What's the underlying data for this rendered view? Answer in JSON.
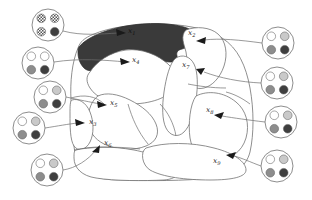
{
  "figure": {
    "background_color": "#ffffff",
    "stroke_color": "#6f6f6f",
    "shaded_region_color": "#3a3a3a",
    "width": 312,
    "height": 200
  },
  "palette": {
    "white": "#ffffff",
    "light_gray": "#c9c9c9",
    "medium_gray": "#8d8d8d",
    "dark_gray": "#3f3f3f",
    "outline": "#707070",
    "shaded": "#3a3a3a",
    "checker": "#555555"
  },
  "region_labels": [
    {
      "id": "x1",
      "base": "x",
      "sub": "1",
      "x": 128,
      "y": 33,
      "on_dark": true
    },
    {
      "id": "x2",
      "base": "x",
      "sub": "2",
      "x": 188,
      "y": 35,
      "on_dark": false
    },
    {
      "id": "x3",
      "base": "x",
      "sub": "3",
      "x": 89,
      "y": 124,
      "on_dark": false
    },
    {
      "id": "x4",
      "base": "x",
      "sub": "4",
      "x": 132,
      "y": 62,
      "on_dark": false
    },
    {
      "id": "x5",
      "base": "x",
      "sub": "5",
      "x": 110,
      "y": 105,
      "on_dark": false
    },
    {
      "id": "x6",
      "base": "x",
      "sub": "6",
      "x": 104,
      "y": 145,
      "on_dark": false
    },
    {
      "id": "x7",
      "base": "x",
      "sub": "7",
      "x": 182,
      "y": 67,
      "on_dark": false
    },
    {
      "id": "x8",
      "base": "x",
      "sub": "8",
      "x": 206,
      "y": 112,
      "on_dark": false
    },
    {
      "id": "x9",
      "base": "x",
      "sub": "9",
      "x": 213,
      "y": 163,
      "on_dark": false
    }
  ],
  "marbles": [
    {
      "id": "marble-1",
      "side": "left",
      "cx": 48,
      "cy": 25,
      "r": 16,
      "dots": [
        "checker",
        "checker",
        "checker",
        "dark_gray"
      ],
      "linked_region": "x1"
    },
    {
      "id": "marble-2",
      "side": "left",
      "cx": 38,
      "cy": 63,
      "r": 16,
      "dots": [
        "white",
        "white",
        "medium_gray",
        "dark_gray"
      ],
      "linked_region": "x4"
    },
    {
      "id": "marble-3",
      "side": "left",
      "cx": 50,
      "cy": 97,
      "r": 16,
      "dots": [
        "white",
        "light_gray",
        "medium_gray",
        "dark_gray"
      ],
      "linked_region": "x5"
    },
    {
      "id": "marble-4",
      "side": "left",
      "cx": 29,
      "cy": 128,
      "r": 16,
      "dots": [
        "white",
        "light_gray",
        "medium_gray",
        "dark_gray"
      ],
      "linked_region": "x3"
    },
    {
      "id": "marble-5",
      "side": "left",
      "cx": 47,
      "cy": 170,
      "r": 16,
      "dots": [
        "white",
        "light_gray",
        "medium_gray",
        "dark_gray"
      ],
      "linked_region": "x6"
    },
    {
      "id": "marble-6",
      "side": "right",
      "cx": 278,
      "cy": 43,
      "r": 16,
      "dots": [
        "white",
        "light_gray",
        "medium_gray",
        "dark_gray"
      ],
      "linked_region": "x2"
    },
    {
      "id": "marble-7",
      "side": "right",
      "cx": 277,
      "cy": 83,
      "r": 16,
      "dots": [
        "white",
        "light_gray",
        "medium_gray",
        "dark_gray"
      ],
      "linked_region": "x7"
    },
    {
      "id": "marble-8",
      "side": "right",
      "cx": 281,
      "cy": 122,
      "r": 16,
      "dots": [
        "white",
        "light_gray",
        "medium_gray",
        "dark_gray"
      ],
      "linked_region": "x8"
    },
    {
      "id": "marble-9",
      "side": "right",
      "cx": 277,
      "cy": 166,
      "r": 16,
      "dots": [
        "white",
        "light_gray",
        "medium_gray",
        "dark_gray"
      ],
      "linked_region": "x9"
    }
  ],
  "diagram_data": {
    "type": "diagram",
    "region_count": 9,
    "marble_count": 9,
    "shaded_regions": [
      "x1"
    ],
    "description": "Nine labelled regions x1-x9 partition a large outer blob; each region is connected by a curved arrow to a circular icon showing a four-marble configuration."
  }
}
